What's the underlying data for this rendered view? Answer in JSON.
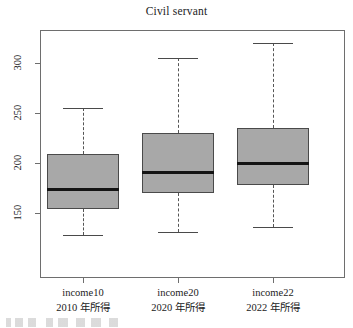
{
  "chart_data": {
    "type": "box",
    "title": "Civil servant",
    "xlabel": "",
    "ylabel": "",
    "ylim": [
      120,
      328
    ],
    "y_ticks": [
      150,
      200,
      250,
      300
    ],
    "y_tick_labels": [
      "150",
      "200",
      "250",
      "300"
    ],
    "grid": false,
    "legend": null,
    "categories": [
      "income10",
      "income20",
      "income22"
    ],
    "category_sublabels": [
      "2010 年所得",
      "2020 年所得",
      "2022 年所得"
    ],
    "boxes": [
      {
        "name": "income10",
        "sublabel": "2010 年所得",
        "whisker_low": 128,
        "q1": 154,
        "median": 174,
        "q3": 209,
        "whisker_high": 255
      },
      {
        "name": "income20",
        "sublabel": "2020 年所得",
        "whisker_low": 131,
        "q1": 170,
        "median": 191,
        "q3": 230,
        "whisker_high": 305
      },
      {
        "name": "income22",
        "sublabel": "2022 年所得",
        "whisker_low": 136,
        "q1": 178,
        "median": 200,
        "q3": 235,
        "whisker_high": 320
      }
    ],
    "colors": {
      "box_fill": "#a8a8a8",
      "box_border": "#4a4a4a",
      "median": "#141414",
      "whisker": "#555555",
      "axis": "#6e6e6e",
      "background": "#ffffff",
      "text": "#222222"
    }
  },
  "axis": {
    "y_labels": [
      "300",
      "250",
      "200",
      "150"
    ],
    "x_labels": [
      {
        "line1": "income10",
        "line2": "2010 年所得"
      },
      {
        "line1": "income20",
        "line2": "2020 年所得"
      },
      {
        "line1": "income22",
        "line2": "2022 年所得"
      }
    ]
  },
  "title": "Civil servant"
}
